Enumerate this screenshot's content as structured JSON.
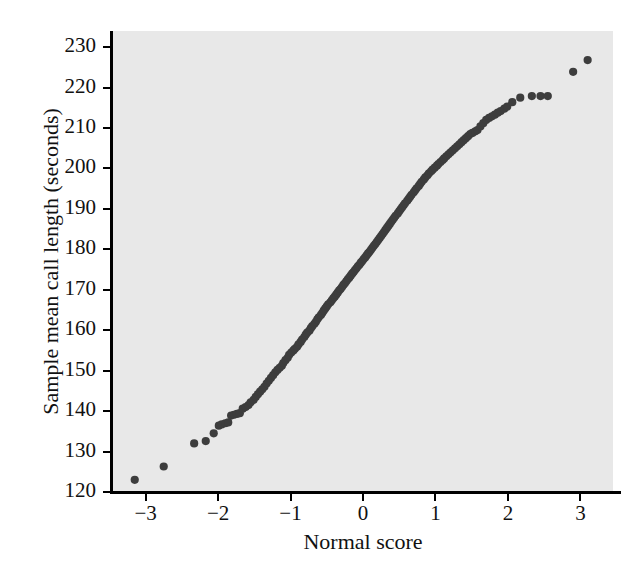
{
  "chart_data": {
    "type": "scatter",
    "title": "",
    "xlabel": "Normal score",
    "ylabel": "Sample mean call length (seconds)",
    "xlim": [
      -3.45,
      3.45
    ],
    "ylim": [
      120,
      234
    ],
    "xticks": [
      -3,
      -2,
      -1,
      0,
      1,
      2,
      3
    ],
    "xticklabels": [
      "−3",
      "−2",
      "−1",
      "0",
      "1",
      "2",
      "3"
    ],
    "yticks": [
      120,
      130,
      140,
      150,
      160,
      170,
      180,
      190,
      200,
      210,
      220,
      230
    ],
    "yticklabels": [
      "120",
      "130",
      "140",
      "150",
      "160",
      "170",
      "180",
      "190",
      "200",
      "210",
      "220",
      "230"
    ],
    "grid": false,
    "legend": null,
    "marker": "filled-circle",
    "marker_color": "#3d3d3d",
    "marker_size": 5,
    "plot_background": "#e8e8e8",
    "figure_background": "#ffffff",
    "series": [
      {
        "name": "Sample mean call length normal probability plot",
        "x": [
          -3.15,
          -2.75,
          -2.33,
          -2.17,
          -2.06,
          -1.99,
          -1.95,
          -1.9,
          -1.86,
          -1.82,
          -1.78,
          -1.74,
          -1.7,
          -1.66,
          -1.62,
          -1.58,
          -1.55,
          -1.51,
          -1.48,
          -1.45,
          -1.42,
          -1.39,
          -1.36,
          -1.33,
          -1.3,
          -1.27,
          -1.24,
          -1.21,
          -1.18,
          -1.15,
          -1.12,
          -1.1,
          -1.07,
          -1.04,
          -1.02,
          -0.99,
          -0.96,
          -0.94,
          -0.91,
          -0.89,
          -0.86,
          -0.84,
          -0.81,
          -0.79,
          -0.77,
          -0.74,
          -0.72,
          -0.7,
          -0.67,
          -0.65,
          -0.63,
          -0.61,
          -0.58,
          -0.56,
          -0.54,
          -0.52,
          -0.5,
          -0.48,
          -0.45,
          -0.43,
          -0.41,
          -0.39,
          -0.37,
          -0.35,
          -0.33,
          -0.31,
          -0.29,
          -0.27,
          -0.25,
          -0.23,
          -0.21,
          -0.19,
          -0.17,
          -0.15,
          -0.13,
          -0.11,
          -0.09,
          -0.07,
          -0.05,
          -0.03,
          -0.01,
          0.01,
          0.03,
          0.05,
          0.07,
          0.09,
          0.11,
          0.13,
          0.15,
          0.17,
          0.19,
          0.21,
          0.23,
          0.25,
          0.27,
          0.29,
          0.31,
          0.33,
          0.35,
          0.37,
          0.39,
          0.41,
          0.43,
          0.45,
          0.48,
          0.5,
          0.52,
          0.54,
          0.56,
          0.58,
          0.61,
          0.63,
          0.65,
          0.67,
          0.7,
          0.72,
          0.74,
          0.77,
          0.79,
          0.81,
          0.84,
          0.86,
          0.89,
          0.91,
          0.94,
          0.96,
          0.99,
          1.02,
          1.04,
          1.07,
          1.1,
          1.12,
          1.15,
          1.18,
          1.21,
          1.24,
          1.27,
          1.3,
          1.33,
          1.36,
          1.39,
          1.42,
          1.45,
          1.48,
          1.51,
          1.55,
          1.58,
          1.62,
          1.66,
          1.7,
          1.74,
          1.78,
          1.82,
          1.86,
          1.9,
          1.95,
          1.99,
          2.06,
          2.17,
          2.33,
          2.45,
          2.55,
          2.9,
          3.1
        ],
        "y": [
          123.0,
          126.3,
          132.0,
          132.6,
          134.5,
          136.4,
          136.7,
          137.0,
          137.2,
          138.9,
          139.1,
          139.3,
          139.5,
          140.6,
          141.0,
          141.5,
          142.2,
          142.8,
          143.5,
          144.2,
          144.8,
          145.4,
          146.0,
          146.8,
          147.5,
          148.2,
          148.9,
          149.6,
          150.2,
          150.7,
          151.2,
          151.9,
          152.6,
          153.2,
          153.9,
          154.5,
          155.0,
          155.4,
          155.9,
          156.5,
          157.1,
          157.7,
          158.3,
          158.9,
          159.4,
          159.9,
          160.5,
          161.0,
          161.6,
          162.1,
          162.7,
          163.2,
          163.8,
          164.3,
          164.9,
          165.4,
          165.9,
          166.4,
          166.9,
          167.4,
          167.9,
          168.3,
          168.8,
          169.3,
          169.8,
          170.2,
          170.7,
          171.2,
          171.6,
          172.1,
          172.6,
          173.0,
          173.5,
          174.0,
          174.4,
          174.9,
          175.3,
          175.8,
          176.2,
          176.7,
          177.1,
          177.6,
          178.0,
          178.5,
          179.0,
          179.4,
          179.9,
          180.4,
          180.9,
          181.3,
          181.8,
          182.3,
          182.8,
          183.3,
          183.8,
          184.3,
          184.8,
          185.3,
          185.8,
          186.3,
          186.8,
          187.3,
          187.8,
          188.3,
          188.9,
          189.4,
          189.9,
          190.4,
          190.9,
          191.4,
          192.0,
          192.5,
          193.0,
          193.5,
          194.1,
          194.6,
          195.1,
          195.7,
          196.2,
          196.7,
          197.3,
          197.8,
          198.3,
          198.8,
          199.3,
          199.7,
          200.2,
          200.7,
          201.1,
          201.6,
          202.1,
          202.5,
          203.0,
          203.5,
          204.0,
          204.5,
          205.0,
          205.5,
          206.0,
          206.5,
          207.0,
          207.5,
          208.0,
          208.5,
          208.8,
          209.2,
          209.5,
          210.4,
          211.2,
          212.0,
          212.5,
          212.9,
          213.3,
          213.8,
          214.2,
          214.8,
          215.3,
          216.4,
          217.5,
          217.9,
          217.9,
          217.9,
          223.9,
          226.8
        ]
      }
    ]
  }
}
